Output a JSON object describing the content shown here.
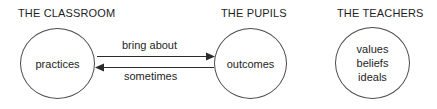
{
  "diagram": {
    "type": "relationship-diagram",
    "groups": [
      {
        "id": "classroom",
        "title": "THE CLASSROOM",
        "node_text": "practices"
      },
      {
        "id": "pupils",
        "title": "THE PUPILS",
        "node_text": "outcomes"
      },
      {
        "id": "teachers",
        "title": "THE TEACHERS",
        "node_lines": [
          "values",
          "beliefs",
          "ideals"
        ]
      }
    ],
    "edges": [
      {
        "id": "practices-to-outcomes",
        "label": "bring about",
        "from": "practices",
        "to": "outcomes",
        "direction": "right"
      },
      {
        "id": "outcomes-to-practices",
        "label": "sometimes",
        "from": "outcomes",
        "to": "practices",
        "direction": "left"
      }
    ],
    "colors": {
      "stroke": "#4a4a4a",
      "arrow": "#2b2b2b",
      "text": "#1e1e1e",
      "background": "#ffffff"
    }
  }
}
